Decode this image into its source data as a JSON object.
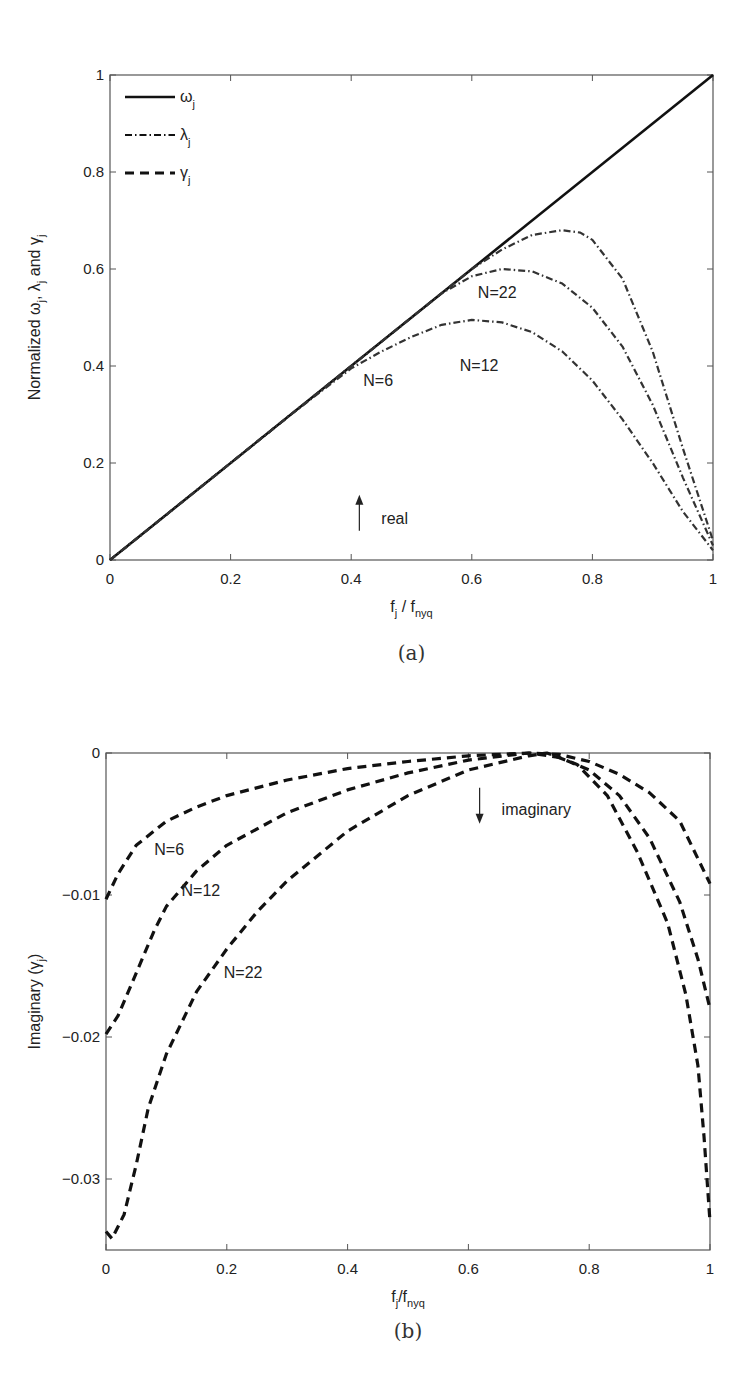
{
  "chart_data": [
    {
      "id": "a",
      "type": "line",
      "caption": "(a)",
      "xlabel": "f_j / f_nyq",
      "ylabel": "Normalized ω_j, λ_j and γ_j",
      "xlim": [
        0,
        1
      ],
      "ylim": [
        0,
        1
      ],
      "xticks": [
        0,
        0.2,
        0.4,
        0.6,
        0.8,
        1
      ],
      "xtick_labels": [
        "0",
        "0.2",
        "0.4",
        "0.6",
        "0.8",
        "1"
      ],
      "yticks": [
        0,
        0.2,
        0.4,
        0.6,
        0.8,
        1
      ],
      "ytick_labels": [
        "0",
        "0.2",
        "0.4",
        "0.6",
        "0.8",
        "1"
      ],
      "grid": false,
      "legend": {
        "position": "upper-left",
        "entries": [
          {
            "label": "ω",
            "sub": "j",
            "style": "solid"
          },
          {
            "label": "λ",
            "sub": "j",
            "style": "dashdot"
          },
          {
            "label": "γ",
            "sub": "j",
            "style": "dashed"
          }
        ]
      },
      "annotations": [
        {
          "text": "N=22",
          "x": 0.61,
          "y": 0.55
        },
        {
          "text": "N=12",
          "x": 0.58,
          "y": 0.4
        },
        {
          "text": "N=6",
          "x": 0.42,
          "y": 0.37
        },
        {
          "text": "real",
          "x": 0.45,
          "y": 0.085,
          "arrow": "up"
        }
      ],
      "series": [
        {
          "name": "ω_j",
          "style": "solid",
          "x": [
            0,
            1
          ],
          "y": [
            0,
            1
          ]
        },
        {
          "name": "λ_j N=6",
          "style": "dashdot",
          "x": [
            0,
            0.1,
            0.2,
            0.3,
            0.4,
            0.45,
            0.5,
            0.55,
            0.6,
            0.65,
            0.7,
            0.75,
            0.8,
            0.85,
            0.9,
            0.95,
            1.0
          ],
          "y": [
            0,
            0.1,
            0.2,
            0.3,
            0.395,
            0.43,
            0.46,
            0.485,
            0.495,
            0.49,
            0.47,
            0.43,
            0.37,
            0.29,
            0.2,
            0.1,
            0.02
          ]
        },
        {
          "name": "λ_j N=12",
          "style": "dashdot",
          "x": [
            0,
            0.1,
            0.2,
            0.3,
            0.4,
            0.5,
            0.55,
            0.6,
            0.65,
            0.7,
            0.75,
            0.8,
            0.85,
            0.9,
            0.95,
            1.0
          ],
          "y": [
            0,
            0.1,
            0.2,
            0.3,
            0.4,
            0.5,
            0.55,
            0.585,
            0.6,
            0.595,
            0.57,
            0.52,
            0.44,
            0.32,
            0.17,
            0.03
          ]
        },
        {
          "name": "λ_j N=22",
          "style": "dashdot",
          "x": [
            0,
            0.1,
            0.2,
            0.3,
            0.4,
            0.5,
            0.6,
            0.65,
            0.7,
            0.75,
            0.78,
            0.8,
            0.85,
            0.9,
            0.95,
            1.0
          ],
          "y": [
            0,
            0.1,
            0.2,
            0.3,
            0.4,
            0.5,
            0.6,
            0.64,
            0.67,
            0.68,
            0.675,
            0.66,
            0.58,
            0.43,
            0.23,
            0.04
          ]
        }
      ]
    },
    {
      "id": "b",
      "type": "line",
      "caption": "(b)",
      "xlabel": "f_j/f_nyq",
      "ylabel": "Imaginary (γ_j)",
      "xlim": [
        0,
        1
      ],
      "ylim": [
        -0.035,
        0
      ],
      "xticks": [
        0,
        0.2,
        0.4,
        0.6,
        0.8,
        1
      ],
      "xtick_labels": [
        "0",
        "0.2",
        "0.4",
        "0.6",
        "0.8",
        "1"
      ],
      "yticks": [
        0,
        -0.01,
        -0.02,
        -0.03
      ],
      "ytick_labels": [
        "0",
        "-0.01",
        "-0.02",
        "-0.03"
      ],
      "grid": false,
      "annotations": [
        {
          "text": "N=6",
          "x": 0.08,
          "y": -0.0068
        },
        {
          "text": "N=12",
          "x": 0.125,
          "y": -0.0097
        },
        {
          "text": "N=22",
          "x": 0.195,
          "y": -0.0155
        },
        {
          "text": "imaginary",
          "x": 0.655,
          "y": -0.004,
          "arrow": "down"
        }
      ],
      "series": [
        {
          "name": "γ_j N=6",
          "style": "dashed",
          "x": [
            0,
            0.02,
            0.05,
            0.1,
            0.15,
            0.2,
            0.3,
            0.4,
            0.5,
            0.6,
            0.7,
            0.75,
            0.8,
            0.85,
            0.9,
            0.95,
            1.0
          ],
          "y": [
            -0.0103,
            -0.0085,
            -0.0065,
            -0.0048,
            -0.0038,
            -0.003,
            -0.0019,
            -0.0011,
            -0.0006,
            -0.0002,
            0,
            -0.0001,
            -0.0006,
            -0.0015,
            -0.0028,
            -0.0048,
            -0.0092
          ]
        },
        {
          "name": "γ_j N=12",
          "style": "dashed",
          "x": [
            0,
            0.02,
            0.05,
            0.08,
            0.1,
            0.15,
            0.2,
            0.3,
            0.4,
            0.5,
            0.6,
            0.7,
            0.75,
            0.8,
            0.85,
            0.9,
            0.95,
            0.98,
            1.0
          ],
          "y": [
            -0.0198,
            -0.0185,
            -0.0155,
            -0.0125,
            -0.0108,
            -0.0083,
            -0.0065,
            -0.0042,
            -0.0026,
            -0.0014,
            -0.0005,
            0,
            -0.0003,
            -0.0012,
            -0.003,
            -0.006,
            -0.0105,
            -0.0145,
            -0.018
          ]
        },
        {
          "name": "γ_j N=22",
          "style": "dashed",
          "x": [
            0,
            0.01,
            0.03,
            0.05,
            0.07,
            0.1,
            0.15,
            0.2,
            0.25,
            0.3,
            0.4,
            0.5,
            0.6,
            0.7,
            0.73,
            0.78,
            0.83,
            0.88,
            0.93,
            0.96,
            0.98,
            0.99,
            1.0
          ],
          "y": [
            -0.0337,
            -0.0342,
            -0.0325,
            -0.029,
            -0.025,
            -0.0212,
            -0.0168,
            -0.0138,
            -0.0112,
            -0.009,
            -0.0055,
            -0.003,
            -0.0012,
            -0.0002,
            0,
            -0.0008,
            -0.003,
            -0.007,
            -0.012,
            -0.017,
            -0.022,
            -0.027,
            -0.033
          ]
        }
      ]
    }
  ]
}
